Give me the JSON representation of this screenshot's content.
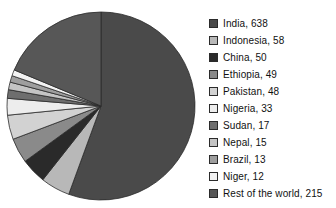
{
  "chart_data": {
    "type": "pie",
    "title": "",
    "subtitle": "",
    "xlabel": "",
    "ylabel": "",
    "legend_position": "right",
    "grid": false,
    "total": 1148,
    "start_angle_deg": 0,
    "direction": "clockwise",
    "categories": [
      "India",
      "Indonesia",
      "China",
      "Ethiopia",
      "Pakistan",
      "Nigeria",
      "Sudan",
      "Nepal",
      "Brazil",
      "Niger",
      "Rest of the world"
    ],
    "values": [
      638,
      58,
      50,
      49,
      48,
      33,
      17,
      15,
      13,
      12,
      215
    ],
    "colors": [
      "#4a4a4a",
      "#b8b8b8",
      "#2a2a2a",
      "#8a8a8a",
      "#d2d2d2",
      "#ededed",
      "#6e6e6e",
      "#c4c4c4",
      "#9e9e9e",
      "#f2f2f2",
      "#575757"
    ],
    "slice_border_color": "#2b2b2b",
    "legend_entries": [
      {
        "label": "India, 638",
        "name": "India",
        "value": 638,
        "color": "#4a4a4a"
      },
      {
        "label": "Indonesia, 58",
        "name": "Indonesia",
        "value": 58,
        "color": "#b8b8b8"
      },
      {
        "label": "China, 50",
        "name": "China",
        "value": 50,
        "color": "#2a2a2a"
      },
      {
        "label": "Ethiopia, 49",
        "name": "Ethiopia",
        "value": 49,
        "color": "#8a8a8a"
      },
      {
        "label": "Pakistan, 48",
        "name": "Pakistan",
        "value": 48,
        "color": "#d2d2d2"
      },
      {
        "label": "Nigeria, 33",
        "name": "Nigeria",
        "value": 33,
        "color": "#ededed"
      },
      {
        "label": "Sudan, 17",
        "name": "Sudan",
        "value": 17,
        "color": "#6e6e6e"
      },
      {
        "label": "Nepal, 15",
        "name": "Nepal",
        "value": 15,
        "color": "#c4c4c4"
      },
      {
        "label": "Brazil, 13",
        "name": "Brazil",
        "value": 13,
        "color": "#9e9e9e"
      },
      {
        "label": "Niger, 12",
        "name": "Niger",
        "value": 12,
        "color": "#f2f2f2"
      },
      {
        "label": "Rest of the world, 215",
        "name": "Rest of the world",
        "value": 215,
        "color": "#575757"
      }
    ]
  },
  "geometry": {
    "cx": 101,
    "cy": 106,
    "r": 94
  }
}
